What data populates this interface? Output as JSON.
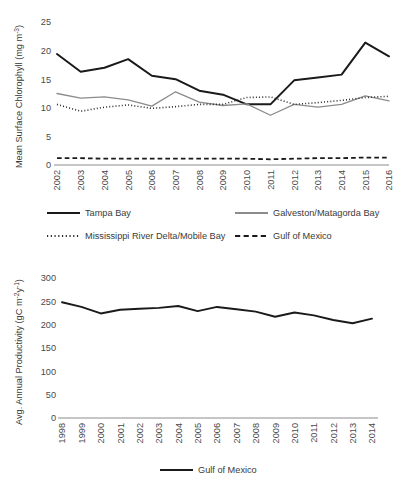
{
  "figure": {
    "name": "two-panel-time-series-figure",
    "background": "#ffffff",
    "colors": {
      "tampa_bay": "#1a1a1a",
      "galveston_matagorda_bay": "#8c8c8c",
      "mississippi_river_delta_mobile_bay": "#2b2b2b",
      "gulf_of_mexico": "#1a1a1a",
      "axis": "#808080",
      "text": "#3a3a3a"
    }
  },
  "chart_data": [
    {
      "type": "line",
      "name": "mean-surface-chlorophyll",
      "title": "",
      "xlabel": "",
      "ylabel": "Mean Surface Chlorophyll (mg m",
      "ylabel_sup": "-3",
      "ylabel_tail": ")",
      "ylim": [
        0,
        25
      ],
      "yticks": [
        0,
        5,
        10,
        15,
        20,
        25
      ],
      "ytick_labels": [
        "0",
        "5",
        "10",
        "15",
        "20",
        "25"
      ],
      "grid": false,
      "legend_position": "below",
      "categories": [
        "2002",
        "2003",
        "2004",
        "2005",
        "2006",
        "2007",
        "2008",
        "2009",
        "2010",
        "2011",
        "2012",
        "2013",
        "2014",
        "2015",
        "2016"
      ],
      "series": [
        {
          "name": "Tampa Bay",
          "style": "solid",
          "color": "#1a1a1a",
          "width": 2.0,
          "values": [
            19.4,
            16.3,
            17.0,
            18.5,
            15.6,
            15.0,
            13.0,
            12.3,
            10.6,
            10.6,
            14.8,
            15.3,
            15.8,
            21.4,
            19.0
          ]
        },
        {
          "name": "Galveston/Matagorda Bay",
          "style": "solid",
          "color": "#8c8c8c",
          "width": 1.3,
          "values": [
            12.5,
            11.7,
            11.9,
            11.4,
            10.3,
            12.8,
            11.0,
            10.4,
            10.7,
            8.7,
            10.6,
            10.1,
            10.6,
            12.1,
            11.2
          ]
        },
        {
          "name": "Mississippi River Delta/Mobile Bay",
          "style": "dotted",
          "color": "#2b2b2b",
          "width": 1.6,
          "values": [
            10.6,
            9.4,
            10.1,
            10.5,
            9.9,
            10.2,
            10.6,
            10.6,
            11.8,
            11.9,
            10.6,
            10.9,
            11.3,
            11.8,
            12.0
          ]
        },
        {
          "name": "Gulf of Mexico",
          "style": "dashed",
          "color": "#1a1a1a",
          "width": 1.8,
          "values": [
            1.2,
            1.2,
            1.1,
            1.1,
            1.1,
            1.1,
            1.1,
            1.1,
            1.1,
            1.0,
            1.1,
            1.2,
            1.2,
            1.3,
            1.3
          ]
        }
      ],
      "legend": [
        {
          "label": "Tampa Bay",
          "style": "solid",
          "color": "#1a1a1a"
        },
        {
          "label": "Galveston/Matagorda Bay",
          "style": "solid",
          "color": "#8c8c8c"
        },
        {
          "label": "Mississippi River Delta/Mobile Bay",
          "style": "dotted",
          "color": "#2b2b2b"
        },
        {
          "label": "Gulf of Mexico",
          "style": "dashed",
          "color": "#1a1a1a"
        }
      ]
    },
    {
      "type": "line",
      "name": "avg-annual-productivity",
      "title": "",
      "xlabel": "",
      "ylabel": "Avg. Annual Productivity (gC m",
      "ylabel_sup": "-2",
      "ylabel_mid": "y",
      "ylabel_sup2": "-1",
      "ylabel_tail": ")",
      "ylim": [
        0,
        300
      ],
      "yticks": [
        0,
        50,
        100,
        150,
        200,
        250,
        300
      ],
      "ytick_labels": [
        "0",
        "50",
        "100",
        "150",
        "200",
        "250",
        "300"
      ],
      "grid": false,
      "legend_position": "below",
      "categories": [
        "1998",
        "1999",
        "2000",
        "2001",
        "2002",
        "2003",
        "2004",
        "2005",
        "2006",
        "2007",
        "2008",
        "2009",
        "2010",
        "2011",
        "2012",
        "2013",
        "2014"
      ],
      "series": [
        {
          "name": "Gulf of Mexico",
          "style": "solid",
          "color": "#1a1a1a",
          "width": 1.9,
          "values": [
            248,
            238,
            224,
            232,
            234,
            236,
            240,
            229,
            238,
            233,
            228,
            217,
            226,
            220,
            210,
            203,
            213,
            207
          ]
        }
      ],
      "legend": [
        {
          "label": "Gulf of Mexico",
          "style": "solid",
          "color": "#1a1a1a"
        }
      ]
    }
  ]
}
